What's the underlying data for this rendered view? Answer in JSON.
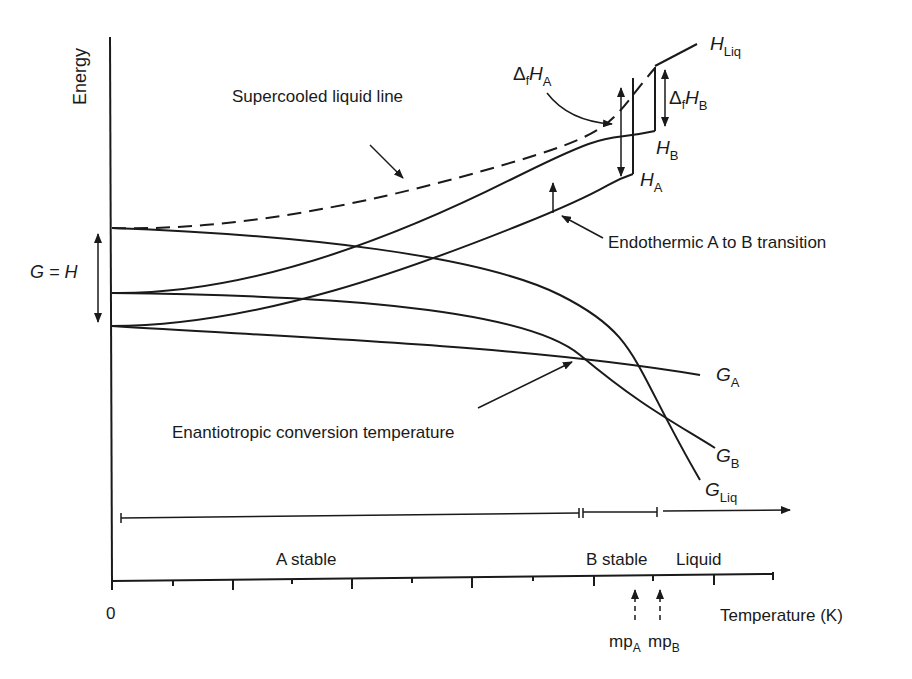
{
  "diagram": {
    "type": "energy-temperature phase diagram",
    "y_axis_label": "Energy",
    "x_axis_label": "Temperature (K)",
    "x_origin_label": "0",
    "gh_label": "G = H",
    "annotations": {
      "supercooled": "Supercooled liquid line",
      "endothermic": "Endothermic A to B transition",
      "enantiotropic": "Enantiotropic conversion temperature"
    },
    "curve_labels": {
      "h_liq": {
        "main": "H",
        "sub": "Liq"
      },
      "h_b": {
        "main": "H",
        "sub": "B"
      },
      "h_a": {
        "main": "H",
        "sub": "A"
      },
      "g_a": {
        "main": "G",
        "sub": "A"
      },
      "g_b": {
        "main": "G",
        "sub": "B"
      },
      "g_liq": {
        "main": "G",
        "sub": "Liq"
      },
      "dfha": {
        "delta": "Δ",
        "f": "f",
        "main": "H",
        "sub": "A"
      },
      "dfhb": {
        "delta": "Δ",
        "f": "f",
        "main": "H",
        "sub": "B"
      }
    },
    "regions": [
      "A stable",
      "B stable",
      "Liquid"
    ],
    "melting_points": [
      {
        "main": "mp",
        "sub": "A"
      },
      {
        "main": "mp",
        "sub": "B"
      }
    ],
    "colors": {
      "line": "#1a1a1a",
      "background": "#ffffff"
    }
  }
}
